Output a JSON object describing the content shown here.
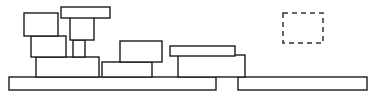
{
  "scene": {
    "title": "Block Stacking Scene",
    "background_color": "#ffffff",
    "width": 378,
    "height": 98,
    "stroke_color": "#1a1a1a",
    "fill_color": "#ffffff",
    "target_stroke_color": "#333333"
  },
  "platforms": [
    {
      "name": "left-ground-platform",
      "x": 9,
      "y": 77,
      "width": 207,
      "height": 13
    },
    {
      "name": "right-ground-platform",
      "x": 238,
      "y": 77,
      "width": 129,
      "height": 13
    }
  ],
  "blocks": [
    {
      "name": "left-stack-base-block",
      "group": "left-stack",
      "x": 36,
      "y": 57,
      "width": 63,
      "height": 20
    },
    {
      "name": "left-stack-middle-block",
      "group": "left-stack",
      "x": 31,
      "y": 36,
      "width": 35,
      "height": 21
    },
    {
      "name": "left-stack-top-block",
      "group": "left-stack",
      "x": 24,
      "y": 13,
      "width": 34,
      "height": 23
    },
    {
      "name": "tower-narrow-column",
      "group": "tower",
      "x": 73,
      "y": 40,
      "width": 12,
      "height": 17
    },
    {
      "name": "tower-mid-block",
      "group": "tower",
      "x": 70,
      "y": 17,
      "width": 24,
      "height": 23
    },
    {
      "name": "tower-top-bar",
      "group": "tower",
      "x": 61,
      "y": 7,
      "width": 49,
      "height": 11
    },
    {
      "name": "center-lower-block",
      "group": "center-stack",
      "x": 102,
      "y": 62,
      "width": 50,
      "height": 15
    },
    {
      "name": "center-upper-block",
      "group": "center-stack",
      "x": 120,
      "y": 41,
      "width": 42,
      "height": 21
    },
    {
      "name": "right-lower-block",
      "group": "right-stack",
      "x": 178,
      "y": 55,
      "width": 67,
      "height": 22
    },
    {
      "name": "right-top-bar",
      "group": "right-stack",
      "x": 170,
      "y": 46,
      "width": 65,
      "height": 10
    }
  ],
  "target_zone": {
    "name": "dashed-target-zone",
    "x": 283,
    "y": 13,
    "width": 40,
    "height": 30,
    "style": "dashed"
  }
}
